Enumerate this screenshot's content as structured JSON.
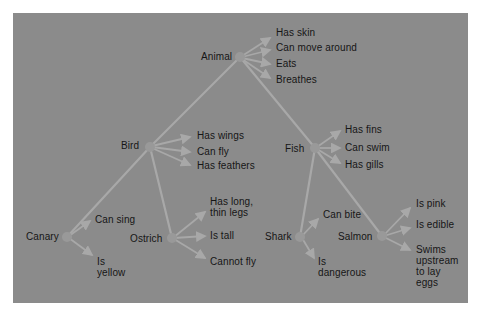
{
  "diagram": {
    "type": "semantic-network",
    "colors": {
      "page_background": "#ffffff",
      "panel_background": "#8b8b8b",
      "link_color": "#a8a8a8",
      "node_color": "#999999",
      "text_color": "#161616"
    },
    "nodes": {
      "animal": {
        "label": "Animal",
        "x": 240,
        "y": 57
      },
      "bird": {
        "label": "Bird",
        "x": 150,
        "y": 147
      },
      "fish": {
        "label": "Fish",
        "x": 315,
        "y": 148
      },
      "canary": {
        "label": "Canary",
        "x": 67,
        "y": 237
      },
      "ostrich": {
        "label": "Ostrich",
        "x": 172,
        "y": 238
      },
      "shark": {
        "label": "Shark",
        "x": 300,
        "y": 237
      },
      "salmon": {
        "label": "Salmon",
        "x": 382,
        "y": 236
      }
    },
    "hierarchy_links": [
      {
        "from": "animal",
        "to": "bird"
      },
      {
        "from": "animal",
        "to": "fish"
      },
      {
        "from": "bird",
        "to": "canary"
      },
      {
        "from": "bird",
        "to": "ostrich"
      },
      {
        "from": "fish",
        "to": "shark"
      },
      {
        "from": "fish",
        "to": "salmon"
      }
    ],
    "properties": {
      "animal": [
        "Has skin",
        "Can move around",
        "Eats",
        "Breathes"
      ],
      "bird": [
        "Has wings",
        "Can fly",
        "Has feathers"
      ],
      "fish": [
        "Has fins",
        "Can swim",
        "Has gills"
      ],
      "canary": [
        "Can sing",
        "Is\nyellow"
      ],
      "ostrich": [
        "Has long,\nthin legs",
        "Is tall",
        "Cannot fly"
      ],
      "shark": [
        "Can bite",
        "Is\ndangerous"
      ],
      "salmon": [
        "Is pink",
        "Is edible",
        "Swims\nupstream\nto lay\neggs"
      ]
    }
  }
}
